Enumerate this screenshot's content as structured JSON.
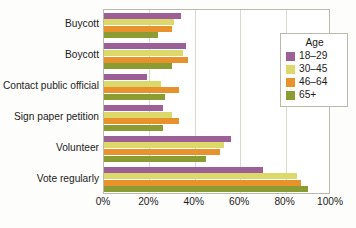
{
  "chart_data": {
    "type": "bar",
    "orientation": "horizontal",
    "grouped": true,
    "title": "",
    "xlabel": "",
    "ylabel": "",
    "xlim": [
      0,
      100
    ],
    "xticks": [
      0,
      20,
      40,
      60,
      80,
      100
    ],
    "xtick_labels": [
      "0%",
      "20%",
      "40%",
      "60%",
      "80%",
      "100%"
    ],
    "grid": true,
    "grid_axis": "x",
    "legend_position": "right",
    "categories": [
      "Buycott",
      "Boycott",
      "Contact public official",
      "Sign paper petition",
      "Volunteer",
      "Vote regularly"
    ],
    "series": [
      {
        "name": "18–29",
        "color": "#9c5f96",
        "values": [
          34,
          36,
          19,
          26,
          56,
          70
        ]
      },
      {
        "name": "30–45",
        "color": "#dcd86a",
        "values": [
          31,
          35,
          25,
          30,
          53,
          85
        ]
      },
      {
        "name": "46–64",
        "color": "#e8922e",
        "values": [
          30,
          37,
          33,
          33,
          51,
          87
        ]
      },
      {
        "name": "65+",
        "color": "#8a9c32",
        "values": [
          24,
          30,
          27,
          26,
          45,
          90
        ]
      }
    ]
  },
  "legend": {
    "title": "Age",
    "entries": [
      {
        "label": "18–29",
        "color": "#9c5f96"
      },
      {
        "label": "30–45",
        "color": "#dcd86a"
      },
      {
        "label": "46–64",
        "color": "#e8922e"
      },
      {
        "label": "65+",
        "color": "#8a9c32"
      }
    ]
  },
  "colors": {
    "plot_background": "#ffffff",
    "page_background": "#fdfdfb",
    "axis_border": "#b9b9ac",
    "gridline": "#d9d9cc",
    "text": "#1c1c1c"
  }
}
